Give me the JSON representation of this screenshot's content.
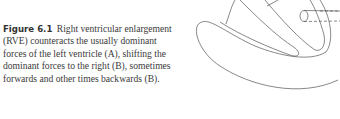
{
  "figure": {
    "label": "Figure 6.1",
    "caption": "Right ventricular enlargement (RVE) counteracts the usually dominant forces of the left ventricle (A), shifting the dominant forces to the right (B), sometimes forwards and other times backwards (B).",
    "illustration": "heart-ventricles-line-drawing"
  }
}
